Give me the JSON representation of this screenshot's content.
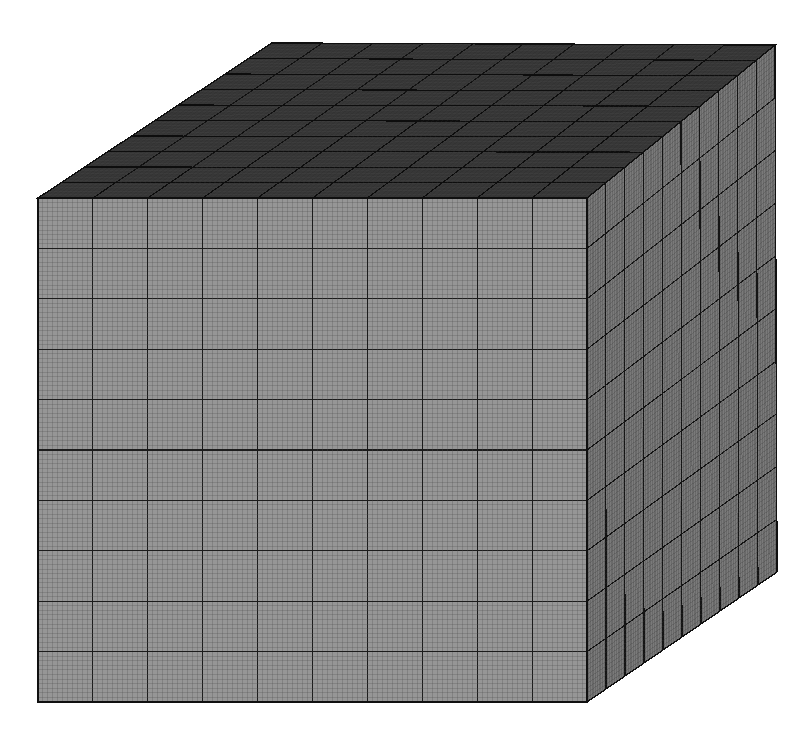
{
  "figure": {
    "name": "hexahedral-mesh-cube",
    "background_color": "#ffffff",
    "width": 806,
    "height": 748
  },
  "chart_data": {
    "type": "diagram",
    "subtype": "3d-structured-mesh",
    "projection": "oblique-axonometric",
    "visible_faces": [
      "front",
      "top",
      "right"
    ],
    "mesh": {
      "divisions_per_edge_major": 10,
      "fine_cells_per_major_block": 11,
      "total_fine_cells_per_edge": 110,
      "element_type": "hexahedron"
    },
    "faces": [
      {
        "name": "front",
        "fill": "#969696",
        "fine_line_color": "#4f4f4f",
        "major_line_color": "#1c1c1c",
        "corners": [
          [
            38,
            198
          ],
          [
            587,
            198
          ],
          [
            587,
            702
          ],
          [
            38,
            702
          ]
        ],
        "major_divisions_u": 10,
        "major_divisions_v": 10
      },
      {
        "name": "right",
        "fill": "#7a7a7a",
        "fine_line_color": "#3c3c3c",
        "major_line_color": "#141414",
        "corners": [
          [
            587,
            198
          ],
          [
            775,
            45
          ],
          [
            777,
            572
          ],
          [
            587,
            702
          ]
        ],
        "major_divisions_u": 10,
        "major_divisions_v": 10
      },
      {
        "name": "top",
        "fill": "#3c3c3c",
        "fine_line_color": "#2a2a2a",
        "major_line_color": "#0d0d0d",
        "corners": [
          [
            38,
            198
          ],
          [
            272,
            43
          ],
          [
            775,
            45
          ],
          [
            587,
            198
          ]
        ],
        "major_divisions_u": 10,
        "major_divisions_v": 10
      }
    ],
    "silhouette_color": "#101010",
    "axis_ranges": {
      "x": [
        0,
        1
      ],
      "y": [
        0,
        1
      ],
      "z": [
        0,
        1
      ]
    },
    "grid": true,
    "legend": null,
    "xlabel": "",
    "ylabel": "",
    "zlabel": ""
  }
}
